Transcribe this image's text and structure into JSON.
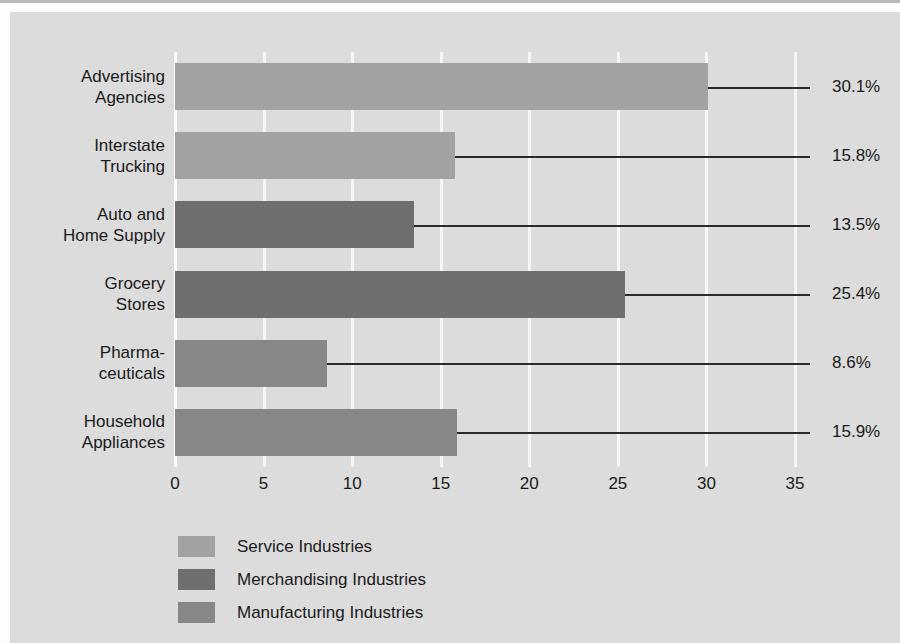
{
  "chart_data": {
    "type": "bar",
    "orientation": "horizontal",
    "title": "",
    "xlabel": "",
    "ylabel": "",
    "xlim": [
      0,
      35
    ],
    "xticks": [
      0,
      5,
      10,
      15,
      20,
      25,
      30,
      35
    ],
    "xtick_labels": [
      "0",
      "5",
      "10",
      "15",
      "20",
      "25",
      "30",
      "35"
    ],
    "grid": true,
    "grid_color": "#f5f5f5",
    "legend_position": "bottom-left",
    "categories": [
      "Advertising\nAgencies",
      "Interstate\nTrucking",
      "Auto and\nHome Supply",
      "Grocery\nStores",
      "Pharma-\nceuticals",
      "Household\nAppliances"
    ],
    "values": [
      30.1,
      15.8,
      13.5,
      25.4,
      8.6,
      15.9
    ],
    "value_labels": [
      "30.1%",
      "15.8%",
      "13.5%",
      "25.4%",
      "8.6%",
      "15.9%"
    ],
    "groups": [
      "Service Industries",
      "Service Industries",
      "Merchandising Industries",
      "Merchandising Industries",
      "Manufacturing Industries",
      "Manufacturing Industries"
    ],
    "group_classes": [
      "service",
      "service",
      "merchandising",
      "merchandising",
      "manufacturing",
      "manufacturing"
    ],
    "legend": [
      {
        "label": "Service Industries",
        "color": "#a2a2a2",
        "class": "service"
      },
      {
        "label": "Merchandising Industries",
        "color": "#6f6f6f",
        "class": "merchandising"
      },
      {
        "label": "Manufacturing Industries",
        "color": "#878787",
        "class": "manufacturing"
      }
    ],
    "colors": {
      "service": "#a2a2a2",
      "merchandising": "#6f6f6f",
      "manufacturing": "#878787",
      "panel_background": "#dcdcdc",
      "gridline": "#f5f5f5",
      "leader_line": "#2a2a2a",
      "text": "#1a1a1a"
    }
  }
}
